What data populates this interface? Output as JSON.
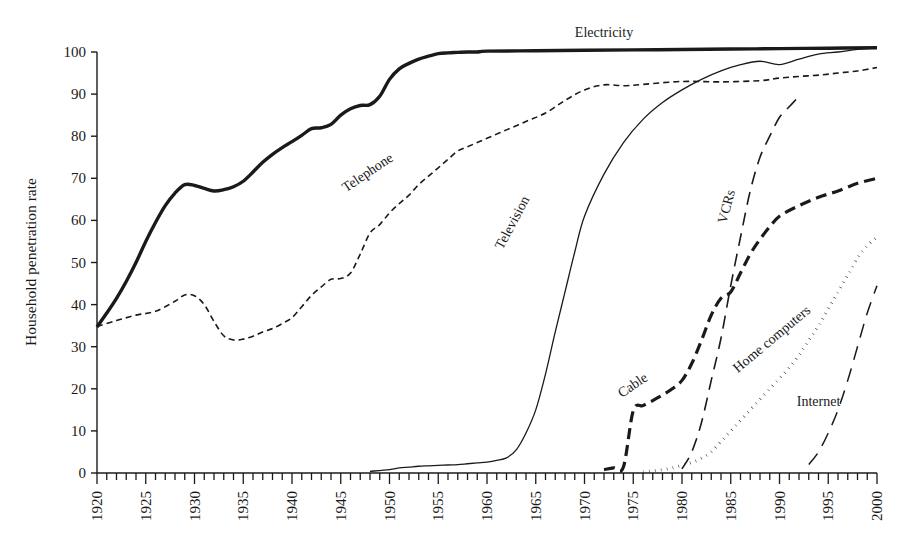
{
  "chart_data": {
    "type": "line",
    "title": "",
    "subtitle": "",
    "xlabel": "",
    "ylabel": "Household penetration rate",
    "xlim": [
      1920,
      2000
    ],
    "ylim": [
      0,
      103
    ],
    "grid": false,
    "legend_position": "inline-labels",
    "y_ticks": [
      0,
      10,
      20,
      30,
      40,
      50,
      60,
      70,
      80,
      90,
      100
    ],
    "x_ticks": [
      1920,
      1925,
      1930,
      1935,
      1940,
      1945,
      1950,
      1955,
      1960,
      1965,
      1970,
      1975,
      1980,
      1985,
      1990,
      1995,
      2000
    ],
    "x_minor_tick_interval": 1,
    "series": [
      {
        "name": "Electricity",
        "label": "Electricity",
        "style": "solid-thick",
        "stroke_width": 3.4,
        "dash": "none",
        "label_x": 1972,
        "label_y": 103.5,
        "label_rotation": 0,
        "x": [
          1920,
          1921,
          1922,
          1923,
          1924,
          1925,
          1926,
          1927,
          1928,
          1929,
          1930,
          1931,
          1932,
          1933,
          1934,
          1935,
          1936,
          1937,
          1938,
          1939,
          1940,
          1941,
          1942,
          1943,
          1944,
          1945,
          1946,
          1947,
          1948,
          1949,
          1950,
          1951,
          1952,
          1953,
          1954,
          1955,
          1956,
          1957,
          1958,
          1959,
          1960,
          1965,
          1970,
          1975,
          1980,
          1985,
          1990,
          1995,
          2000
        ],
        "y": [
          34.7,
          38.0,
          41.5,
          45.5,
          50.0,
          55.0,
          59.5,
          63.5,
          66.5,
          68.5,
          68.3,
          67.6,
          67.0,
          67.3,
          68.0,
          69.3,
          71.5,
          73.8,
          75.7,
          77.3,
          78.7,
          80.2,
          81.8,
          82.0,
          82.8,
          85.0,
          86.5,
          87.3,
          87.5,
          89.5,
          93.5,
          96.0,
          97.3,
          98.3,
          99.0,
          99.6,
          99.8,
          99.9,
          100.0,
          100.0,
          100.2,
          100.3,
          100.4,
          100.5,
          100.6,
          100.7,
          100.8,
          100.9,
          101.0
        ]
      },
      {
        "name": "Telephone",
        "label": "Telephone",
        "style": "short-dash",
        "stroke_width": 1.6,
        "dash": "6 4",
        "label_x": 1948,
        "label_y": 70.5,
        "label_rotation": -34,
        "x": [
          1920,
          1922,
          1924,
          1926,
          1928,
          1929,
          1930,
          1931,
          1932,
          1933,
          1934,
          1935,
          1936,
          1937,
          1938,
          1939,
          1940,
          1941,
          1942,
          1943,
          1944,
          1945,
          1946,
          1947,
          1948,
          1949,
          1950,
          1951,
          1952,
          1953,
          1954,
          1955,
          1956,
          1957,
          1958,
          1959,
          1960,
          1962,
          1964,
          1966,
          1968,
          1970,
          1972,
          1974,
          1976,
          1980,
          1984,
          1988,
          1990,
          1992,
          1994,
          1996,
          1998,
          2000
        ],
        "y": [
          34.8,
          36.2,
          37.5,
          38.4,
          40.8,
          42.3,
          42.1,
          40.0,
          36.0,
          32.6,
          31.6,
          31.8,
          32.5,
          33.5,
          34.3,
          35.5,
          36.9,
          39.5,
          42.2,
          44.2,
          46.0,
          46.2,
          47.5,
          52.0,
          57.0,
          59.0,
          61.8,
          64.0,
          66.0,
          68.5,
          70.5,
          72.5,
          74.5,
          76.5,
          77.5,
          78.5,
          79.5,
          81.5,
          83.5,
          85.5,
          88.5,
          91.0,
          92.2,
          92.0,
          92.3,
          93.0,
          92.9,
          93.2,
          93.8,
          94.2,
          94.5,
          95.0,
          95.5,
          96.3
        ]
      },
      {
        "name": "Television",
        "label": "Television",
        "style": "thin-solid",
        "stroke_width": 1.3,
        "dash": "none",
        "label_x": 1963,
        "label_y": 59.0,
        "label_rotation": -62,
        "x": [
          1948,
          1950,
          1951,
          1952,
          1953,
          1954,
          1955,
          1956,
          1957,
          1958,
          1959,
          1960,
          1961,
          1962,
          1963,
          1964,
          1965,
          1966,
          1967,
          1968,
          1969,
          1970,
          1972,
          1974,
          1976,
          1978,
          1980,
          1982,
          1984,
          1986,
          1988,
          1990,
          1992,
          1994,
          1996,
          1998,
          2000
        ],
        "y": [
          0.4,
          0.8,
          1.2,
          1.4,
          1.6,
          1.7,
          1.8,
          1.9,
          2.0,
          2.2,
          2.4,
          2.6,
          3.0,
          3.6,
          5.5,
          9.5,
          15.0,
          23.5,
          33.5,
          43.0,
          52.5,
          61.0,
          71.0,
          78.5,
          84.0,
          88.0,
          91.0,
          93.5,
          95.5,
          97.0,
          97.8,
          97.0,
          98.3,
          99.5,
          100.0,
          100.6,
          101.0
        ]
      },
      {
        "name": "Cable",
        "label": "Cable",
        "style": "long-dash-thick",
        "stroke_width": 3.2,
        "dash": "11 6",
        "label_x": 1975.2,
        "label_y": 20.0,
        "label_rotation": -34,
        "x": [
          1972,
          1973,
          1974,
          1975,
          1976,
          1977,
          1978,
          1979,
          1980,
          1981,
          1982,
          1983,
          1984,
          1985,
          1986,
          1987,
          1988,
          1989,
          1990,
          1992,
          1994,
          1996,
          1998,
          2000
        ],
        "y": [
          0.8,
          1.2,
          1.5,
          14.8,
          16.0,
          17.2,
          18.5,
          20.0,
          22.0,
          26.0,
          31.5,
          37.5,
          41.5,
          43.0,
          47.5,
          52.0,
          55.5,
          58.5,
          61.0,
          63.5,
          65.5,
          67.0,
          68.8,
          70.0
        ]
      },
      {
        "name": "VCRs",
        "label": "VCRs",
        "style": "medium-dash",
        "stroke_width": 1.6,
        "dash": "13 8",
        "label_x": 1985.0,
        "label_y": 63.0,
        "label_rotation": -75,
        "x": [
          1980,
          1981,
          1982,
          1983,
          1984,
          1985,
          1986,
          1987,
          1988,
          1989,
          1990,
          1991,
          1992
        ],
        "y": [
          1.0,
          5.0,
          12.0,
          22.0,
          32.0,
          44.5,
          56.0,
          67.0,
          75.0,
          80.0,
          84.5,
          87.0,
          89.5
        ]
      },
      {
        "name": "Home computers",
        "label": "Home computers",
        "style": "dotted",
        "stroke_width": 3.0,
        "dash": "0.5 5.5",
        "label_x": 1989.5,
        "label_y": 31.0,
        "label_rotation": -40,
        "x": [
          1976,
          1977,
          1978,
          1979,
          1980,
          1981,
          1982,
          1983,
          1984,
          1985,
          1986,
          1987,
          1988,
          1989,
          1990,
          1991,
          1992,
          1993,
          1994,
          1995,
          1996,
          1997,
          1998,
          1999,
          2000
        ],
        "y": [
          0.3,
          0.5,
          0.8,
          1.2,
          1.8,
          2.5,
          3.5,
          5.0,
          7.5,
          10.0,
          12.5,
          15.0,
          17.5,
          20.0,
          22.5,
          25.0,
          28.0,
          31.5,
          35.0,
          39.0,
          43.0,
          47.0,
          51.0,
          54.0,
          56.0
        ]
      },
      {
        "name": "Internet",
        "label": "Internet",
        "style": "long-dash-thin",
        "stroke_width": 1.5,
        "dash": "14 9",
        "label_x": 1994.0,
        "label_y": 16.0,
        "label_rotation": 0,
        "x": [
          1993,
          1994,
          1995,
          1996,
          1997,
          1998,
          1999,
          2000
        ],
        "y": [
          2.0,
          5.0,
          9.5,
          15.0,
          22.0,
          30.0,
          38.0,
          44.5
        ]
      }
    ]
  }
}
